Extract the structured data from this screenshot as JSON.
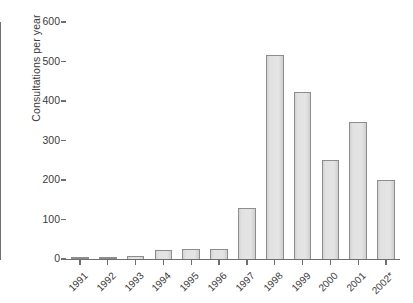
{
  "chart_data": {
    "type": "bar",
    "title": "",
    "subtitle": "",
    "xlabel": "",
    "ylabel": "Consultations per year",
    "categories": [
      "1991",
      "1992",
      "1993",
      "1994",
      "1995",
      "1996",
      "1997",
      "1998",
      "1999",
      "2000",
      "2001",
      "2002*"
    ],
    "values": [
      2,
      4,
      8,
      24,
      25,
      25,
      129,
      517,
      422,
      251,
      347,
      199
    ],
    "series": [
      {
        "name": "Consultations per year",
        "values": [
          2,
          4,
          8,
          24,
          25,
          25,
          129,
          517,
          422,
          251,
          347,
          199
        ]
      }
    ],
    "ylim": [
      0,
      600
    ],
    "y_ticks": [
      0,
      100,
      200,
      300,
      400,
      500,
      600
    ],
    "y_tick_labels": [
      "0",
      "100",
      "200",
      "300",
      "400",
      "500",
      "600"
    ],
    "grid": false,
    "legend": false,
    "legend_position": "none",
    "bar_fill_color": "#e0e0e0",
    "bar_edge_color": "#8d8d8d",
    "axis_color": "#6f6f6f",
    "text_color": "#3b3b3b",
    "background_color": "#ffffff",
    "x_tick_label_rotation": -45,
    "annotations": [
      "2002 label carries an asterisk footnote marker"
    ]
  }
}
